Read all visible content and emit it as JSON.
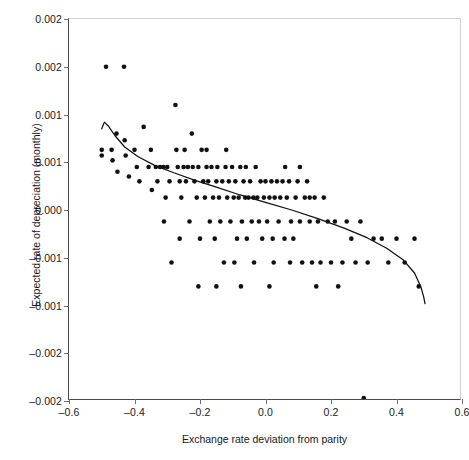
{
  "chart_data": {
    "type": "scatter",
    "title": "",
    "xlabel": "Exchange rate deviation from parity",
    "ylabel": "Expected rate of depreciation (monthly)",
    "xlim": [
      -0.6,
      0.6
    ],
    "ylim": [
      -0.002,
      0.002
    ],
    "xticks": [
      -0.6,
      -0.4,
      -0.2,
      0.0,
      0.2,
      0.4,
      0.6
    ],
    "xticklabels": [
      "–0.6",
      "–0.4",
      "–0.2",
      "0.0",
      "0.2",
      "0.4",
      "0.6"
    ],
    "yticks": [
      0.002,
      0.0015,
      0.001,
      0.0005,
      0.0,
      -0.0005,
      -0.001,
      -0.0015,
      -0.002
    ],
    "yticklabels": [
      "0.002",
      "0.002",
      "0.001",
      "0.001",
      "0.000",
      "–0.001",
      "–0.001",
      "–0.002",
      "–0.002"
    ],
    "grid": false,
    "legend": null,
    "marker": {
      "shape": "circle",
      "color": "#111111",
      "size": 4.6
    },
    "points": [
      [
        -0.5,
        0.00063
      ],
      [
        -0.5,
        0.00057
      ],
      [
        -0.487,
        0.0015
      ],
      [
        -0.47,
        0.00063
      ],
      [
        -0.467,
        0.00052
      ],
      [
        -0.455,
        0.0008
      ],
      [
        -0.452,
        0.0004
      ],
      [
        -0.432,
        0.0015
      ],
      [
        -0.43,
        0.00073
      ],
      [
        -0.427,
        0.00057
      ],
      [
        -0.417,
        0.00035
      ],
      [
        -0.4,
        0.00063
      ],
      [
        -0.393,
        0.00045
      ],
      [
        -0.385,
        0.0003
      ],
      [
        -0.372,
        0.00087
      ],
      [
        -0.365,
        0.0024
      ],
      [
        -0.357,
        0.00045
      ],
      [
        -0.35,
        0.00063
      ],
      [
        -0.347,
        0.00021
      ],
      [
        -0.335,
        0.00045
      ],
      [
        -0.33,
        0.0003
      ],
      [
        -0.322,
        0.00045
      ],
      [
        -0.312,
        0.00045
      ],
      [
        -0.305,
        0.00013
      ],
      [
        -0.3,
        0.00045
      ],
      [
        -0.293,
        0.0003
      ],
      [
        -0.287,
        -0.00055
      ],
      [
        -0.275,
        0.0011
      ],
      [
        -0.272,
        0.00063
      ],
      [
        -0.268,
        0.00045
      ],
      [
        -0.262,
        0.0003
      ],
      [
        -0.257,
        0.00013
      ],
      [
        -0.25,
        0.00045
      ],
      [
        -0.243,
        0.0003
      ],
      [
        -0.237,
        0.00045
      ],
      [
        -0.232,
        -0.00012
      ],
      [
        -0.225,
        0.0008
      ],
      [
        -0.222,
        0.00045
      ],
      [
        -0.217,
        0.0003
      ],
      [
        -0.21,
        0.00013
      ],
      [
        -0.205,
        0.00045
      ],
      [
        -0.2,
        -0.0003
      ],
      [
        -0.195,
        0.00063
      ],
      [
        -0.19,
        0.0003
      ],
      [
        -0.185,
        0.00013
      ],
      [
        -0.18,
        0.00045
      ],
      [
        -0.175,
        0.0003
      ],
      [
        -0.17,
        -0.00012
      ],
      [
        -0.165,
        0.00045
      ],
      [
        -0.16,
        0.00013
      ],
      [
        -0.155,
        -0.0003
      ],
      [
        -0.15,
        0.0003
      ],
      [
        -0.147,
        0.00045
      ],
      [
        -0.142,
        0.00013
      ],
      [
        -0.138,
        -0.00012
      ],
      [
        -0.132,
        0.0003
      ],
      [
        -0.127,
        -0.00055
      ],
      [
        -0.122,
        0.00045
      ],
      [
        -0.117,
        0.00013
      ],
      [
        -0.112,
        0.0003
      ],
      [
        -0.107,
        -0.00012
      ],
      [
        -0.102,
        0.00045
      ],
      [
        -0.097,
        0.00013
      ],
      [
        -0.092,
        0.0003
      ],
      [
        -0.087,
        -0.0003
      ],
      [
        -0.082,
        0.00013
      ],
      [
        -0.077,
        0.00045
      ],
      [
        -0.072,
        -0.00012
      ],
      [
        -0.067,
        0.0003
      ],
      [
        -0.062,
        0.00013
      ],
      [
        -0.057,
        -0.0003
      ],
      [
        -0.052,
        0.00013
      ],
      [
        -0.047,
        0.0003
      ],
      [
        -0.042,
        -0.00012
      ],
      [
        -0.037,
        0.00013
      ],
      [
        -0.03,
        0.00045
      ],
      [
        -0.025,
        0.00013
      ],
      [
        -0.02,
        -0.00012
      ],
      [
        -0.015,
        0.0003
      ],
      [
        -0.01,
        -0.0003
      ],
      [
        -0.005,
        0.00013
      ],
      [
        0.0,
        0.0003
      ],
      [
        0.005,
        -0.00012
      ],
      [
        0.012,
        0.00013
      ],
      [
        0.018,
        0.0003
      ],
      [
        0.022,
        -0.0003
      ],
      [
        0.028,
        0.00013
      ],
      [
        0.035,
        0.0003
      ],
      [
        0.04,
        -0.00012
      ],
      [
        0.045,
        0.00013
      ],
      [
        0.052,
        0.0003
      ],
      [
        0.058,
        -0.0003
      ],
      [
        0.065,
        0.00013
      ],
      [
        0.072,
        0.0003
      ],
      [
        0.078,
        -0.00012
      ],
      [
        0.085,
        -0.0003
      ],
      [
        0.092,
        0.00013
      ],
      [
        0.098,
        0.0003
      ],
      [
        0.105,
        -0.00012
      ],
      [
        0.112,
        -0.00055
      ],
      [
        0.12,
        0.00013
      ],
      [
        0.127,
        0.0003
      ],
      [
        0.135,
        -0.00012
      ],
      [
        0.142,
        -0.00055
      ],
      [
        0.15,
        0.00013
      ],
      [
        0.16,
        -0.00012
      ],
      [
        0.168,
        -0.00055
      ],
      [
        0.178,
        0.00013
      ],
      [
        0.19,
        -0.00012
      ],
      [
        0.2,
        -0.00055
      ],
      [
        0.212,
        -0.00012
      ],
      [
        0.222,
        -0.0008
      ],
      [
        0.235,
        -0.00055
      ],
      [
        0.248,
        -0.00012
      ],
      [
        0.262,
        -0.0003
      ],
      [
        0.275,
        -0.00055
      ],
      [
        0.29,
        -0.00012
      ],
      [
        0.3,
        -0.00197
      ],
      [
        0.312,
        -0.00055
      ],
      [
        0.33,
        -0.0003
      ],
      [
        0.355,
        -0.0003
      ],
      [
        0.375,
        -0.00055
      ],
      [
        0.4,
        -0.0003
      ],
      [
        0.425,
        -0.00055
      ],
      [
        0.455,
        -0.0003
      ],
      [
        0.468,
        -0.0008
      ],
      [
        -0.247,
        0.00063
      ],
      [
        -0.18,
        0.00063
      ],
      [
        -0.12,
        0.00063
      ],
      [
        -0.06,
        0.00045
      ],
      [
        0.06,
        0.00045
      ],
      [
        0.105,
        0.00045
      ],
      [
        0.135,
        0.00013
      ],
      [
        0.075,
        -0.00055
      ],
      [
        0.025,
        -0.00055
      ],
      [
        -0.035,
        -0.00055
      ],
      [
        -0.095,
        -0.00055
      ],
      [
        -0.205,
        -0.0008
      ],
      [
        -0.15,
        -0.0008
      ],
      [
        -0.075,
        -0.0008
      ],
      [
        0.012,
        -0.0008
      ],
      [
        0.155,
        -0.0008
      ],
      [
        -0.262,
        -0.0003
      ],
      [
        -0.31,
        -0.00012
      ]
    ],
    "fit_curve": {
      "name": "fitted trend",
      "color": "#111111",
      "x": [
        -0.5,
        -0.492,
        -0.48,
        -0.46,
        -0.43,
        -0.39,
        -0.34,
        -0.28,
        -0.215,
        -0.15,
        -0.08,
        0.0,
        0.08,
        0.16,
        0.24,
        0.31,
        0.37,
        0.42,
        0.455,
        0.475,
        0.483,
        0.487
      ],
      "y": [
        0.00085,
        0.00092,
        0.00088,
        0.00078,
        0.00066,
        0.00056,
        0.00047,
        0.00039,
        0.00031,
        0.00024,
        0.00016,
        8e-05,
        0.0,
        -9e-05,
        -0.00019,
        -0.00029,
        -0.0004,
        -0.00052,
        -0.00066,
        -0.00081,
        -0.00091,
        -0.00098
      ]
    }
  },
  "caption": {
    "fragment": ""
  }
}
